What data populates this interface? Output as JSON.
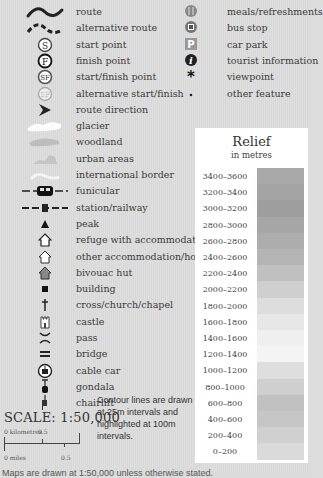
{
  "legend_left": [
    {
      "icon": "route-line-icon",
      "label": "route"
    },
    {
      "icon": "alternative-route-dashed-icon",
      "label": "alternative route"
    },
    {
      "icon": "start-point-s-icon",
      "label": "start point"
    },
    {
      "icon": "finish-point-f-icon",
      "label": "finish point"
    },
    {
      "icon": "start-finish-sf-icon",
      "label": "start/finish point"
    },
    {
      "icon": "alt-start-finish-sf-icon",
      "label": "alternative start/finish"
    },
    {
      "icon": "route-direction-arrow-icon",
      "label": "route direction"
    },
    {
      "icon": "glacier-patch-icon",
      "label": "glacier"
    },
    {
      "icon": "woodland-patch-icon",
      "label": "woodland"
    },
    {
      "icon": "urban-area-patch-icon",
      "label": "urban areas"
    },
    {
      "icon": "international-border-icon",
      "label": "international border"
    },
    {
      "icon": "funicular-icon",
      "label": "funicular"
    },
    {
      "icon": "station-railway-icon",
      "label": "station/railway"
    },
    {
      "icon": "peak-triangle-icon",
      "label": "peak"
    },
    {
      "icon": "refuge-house-icon",
      "label": "refuge with accommodation"
    },
    {
      "icon": "other-accommodation-house-icon",
      "label": "other accommodation/hotel"
    },
    {
      "icon": "bivouac-hut-icon",
      "label": "bivouac hut"
    },
    {
      "icon": "building-square-icon",
      "label": "building"
    },
    {
      "icon": "cross-church-icon",
      "label": "cross/church/chapel"
    },
    {
      "icon": "castle-icon",
      "label": "castle"
    },
    {
      "icon": "pass-icon",
      "label": "pass"
    },
    {
      "icon": "bridge-icon",
      "label": "bridge"
    },
    {
      "icon": "cable-car-icon",
      "label": "cable car"
    },
    {
      "icon": "gondola-icon",
      "label": "gondala"
    },
    {
      "icon": "chairlift-icon",
      "label": "chairlift"
    }
  ],
  "legend_right": [
    {
      "icon": "meals-refreshments-icon",
      "label": "meals/refreshments"
    },
    {
      "icon": "bus-stop-icon",
      "label": "bus stop"
    },
    {
      "icon": "car-park-icon",
      "label": "car park",
      "glyph": "P"
    },
    {
      "icon": "tourist-information-icon",
      "label": "tourist information",
      "glyph": "i"
    },
    {
      "icon": "viewpoint-asterisk-icon",
      "label": "viewpoint",
      "glyph": "✱"
    },
    {
      "icon": "other-feature-dot-icon",
      "label": "other feature",
      "glyph": "•"
    }
  ],
  "start_glyphs": {
    "s": "S",
    "f": "F",
    "sf": "SF"
  },
  "relief": {
    "title": "Relief",
    "subtitle": "in metres",
    "bands": [
      {
        "label": "3400–3600",
        "color": "#a9a9a9"
      },
      {
        "label": "3200–3400",
        "color": "#a4a4a4"
      },
      {
        "label": "3000–3200",
        "color": "#9e9e9e"
      },
      {
        "label": "2800–3000",
        "color": "#a6a6a6"
      },
      {
        "label": "2600–2800",
        "color": "#adadad"
      },
      {
        "label": "2400–2600",
        "color": "#b4b4b4"
      },
      {
        "label": "2200–2400",
        "color": "#c0c0c0"
      },
      {
        "label": "2000–2200",
        "color": "#cfcfcf"
      },
      {
        "label": "1800–2000",
        "color": "#dddddd"
      },
      {
        "label": "1600–1800",
        "color": "#e7e7e7"
      },
      {
        "label": "1400–1600",
        "color": "#efefef"
      },
      {
        "label": "1200–1400",
        "color": "#f4f4f4"
      },
      {
        "label": "1000–1200",
        "color": "#dedede"
      },
      {
        "label": "800–1000",
        "color": "#cfcfcf"
      },
      {
        "label": "600–800",
        "color": "#c1c1c1"
      },
      {
        "label": "400–600",
        "color": "#c6c6c6"
      },
      {
        "label": "200–400",
        "color": "#d0d0d0"
      },
      {
        "label": "0–200",
        "color": "#dadada"
      }
    ]
  },
  "scale": {
    "title": "SCALE: 1:50,000",
    "km_label": "0 kilometres",
    "km_mid": "0.5",
    "km_end": "1",
    "mi_label": "0 miles",
    "mi_mid": "0.5"
  },
  "contour_note": "Contour lines are drawn at 25m intervals and highlighted at 100m intervals.",
  "footer_cut": "Maps are drawn at 1:50,000 unless otherwise stated."
}
